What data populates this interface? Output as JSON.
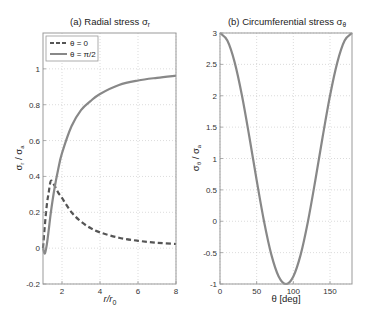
{
  "chart_data": [
    {
      "type": "line",
      "title": "(a) Radial stress σ",
      "title_subscript": "r",
      "xlabel": "r/r",
      "xlabel_subscript": "0",
      "ylabel": "σ",
      "ylabel_subscript": "r",
      "ylabel_denominator": "σ",
      "ylabel_denominator_subscript": "a",
      "xlim": [
        1,
        8
      ],
      "ylim": [
        -0.2,
        1.2
      ],
      "xticks": [
        2,
        4,
        6,
        8
      ],
      "yticks": [
        -0.2,
        0,
        0.2,
        0.4,
        0.6,
        0.8,
        1
      ],
      "grid": true,
      "legend": {
        "placement": "top-left",
        "entries": [
          "θ = 0",
          "θ = π/2"
        ]
      },
      "series": [
        {
          "name": "θ = 0",
          "style": "dashed",
          "color": "#555555",
          "formula": "(3/2)(1/r^2) - (3/2)(1/r^4) ... sampled",
          "x": [
            1.0,
            1.1,
            1.2,
            1.3,
            1.414,
            1.6,
            1.8,
            2.0,
            2.5,
            3.0,
            3.5,
            4.0,
            5.0,
            6.0,
            7.0,
            8.0
          ],
          "y": [
            0.0,
            0.13,
            0.24,
            0.31,
            0.375,
            0.35,
            0.31,
            0.28,
            0.2,
            0.148,
            0.112,
            0.088,
            0.058,
            0.041,
            0.03,
            0.023
          ]
        },
        {
          "name": "θ = π/2",
          "style": "solid",
          "color": "#888888",
          "x": [
            1.0,
            1.1,
            1.2,
            1.3,
            1.414,
            1.6,
            1.8,
            2.0,
            2.5,
            3.0,
            3.5,
            4.0,
            5.0,
            6.0,
            7.0,
            8.0
          ],
          "y": [
            0.0,
            -0.03,
            0.02,
            0.1,
            0.2,
            0.33,
            0.44,
            0.53,
            0.68,
            0.77,
            0.82,
            0.86,
            0.91,
            0.935,
            0.95,
            0.962
          ]
        }
      ]
    },
    {
      "type": "line",
      "title": "(b) Circumferential stress σ",
      "title_subscript": "θ",
      "xlabel": "θ [deg]",
      "ylabel": "σ",
      "ylabel_subscript": "θ",
      "ylabel_denominator": "σ",
      "ylabel_denominator_subscript": "a",
      "xlim": [
        0,
        180
      ],
      "ylim": [
        -1,
        3
      ],
      "xticks": [
        0,
        50,
        100,
        150
      ],
      "yticks": [
        -1,
        -0.5,
        0,
        0.5,
        1,
        1.5,
        2,
        2.5,
        3
      ],
      "grid": true,
      "series": [
        {
          "name": "σθ/σa = 1 + 2cos(2θ)",
          "style": "solid",
          "color": "#888888",
          "x": [
            0,
            10,
            20,
            30,
            40,
            50,
            60,
            70,
            80,
            90,
            100,
            110,
            120,
            130,
            140,
            150,
            160,
            170,
            180
          ],
          "y": [
            3,
            2.879,
            2.532,
            2.0,
            1.347,
            0.653,
            0.0,
            -0.532,
            -0.879,
            -1.0,
            -0.879,
            -0.532,
            0.0,
            0.653,
            1.347,
            2.0,
            2.532,
            2.879,
            3.0
          ]
        }
      ]
    }
  ]
}
